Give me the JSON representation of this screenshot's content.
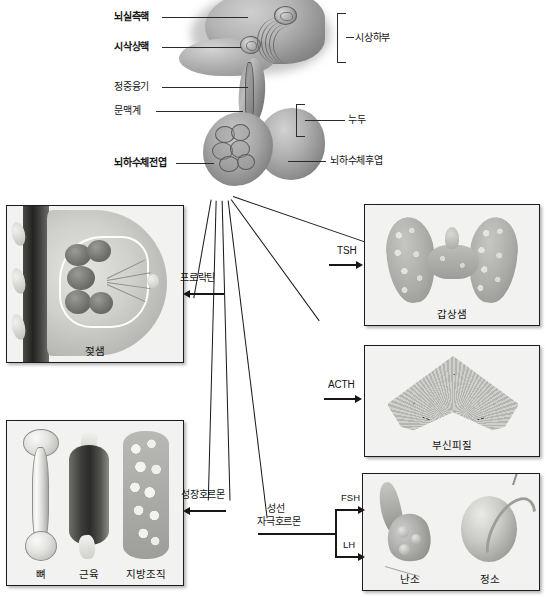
{
  "diagram": {
    "anatomy_labels": [
      {
        "id": "paraventricular-nucleus",
        "text": "뇌실측핵",
        "bold": true
      },
      {
        "id": "supraoptic-nucleus",
        "text": "시삭상핵",
        "bold": true
      },
      {
        "id": "median-eminence",
        "text": "정중융기",
        "bold": false
      },
      {
        "id": "portal-system",
        "text": "문맥계",
        "bold": false
      },
      {
        "id": "anterior-pituitary",
        "text": "뇌하수체전엽",
        "bold": true
      },
      {
        "id": "hypothalamus",
        "text": "시상하부",
        "bold": false
      },
      {
        "id": "infundibulum",
        "text": "누두",
        "bold": false
      },
      {
        "id": "posterior-pituitary",
        "text": "뇌하수체후엽",
        "bold": false
      }
    ],
    "hormones": [
      {
        "id": "prolactin",
        "text": "프로락틴"
      },
      {
        "id": "tsh",
        "text": "TSH"
      },
      {
        "id": "acth",
        "text": "ACTH"
      },
      {
        "id": "growth-hormone",
        "text": "성장호르몬"
      },
      {
        "id": "gonadotropin-line1",
        "text": "성선"
      },
      {
        "id": "gonadotropin-line2",
        "text": "자극호르몬"
      },
      {
        "id": "fsh",
        "text": "FSH"
      },
      {
        "id": "lh",
        "text": "LH"
      }
    ],
    "panels": [
      {
        "id": "mammary-gland",
        "captions": [
          "젖샘"
        ]
      },
      {
        "id": "thyroid-gland",
        "captions": [
          "갑상샘"
        ]
      },
      {
        "id": "adrenal-cortex",
        "captions": [
          "부신피질"
        ]
      },
      {
        "id": "growth-targets",
        "captions": [
          "뼈",
          "근육",
          "지방조직"
        ]
      },
      {
        "id": "gonads",
        "captions": [
          "난소",
          "정소"
        ]
      }
    ],
    "colors": {
      "background": "#ffffff",
      "panel_fill": "#f2f2f0",
      "panel_border": "#1c1c1c",
      "line": "#171717",
      "text": "#141414"
    }
  }
}
